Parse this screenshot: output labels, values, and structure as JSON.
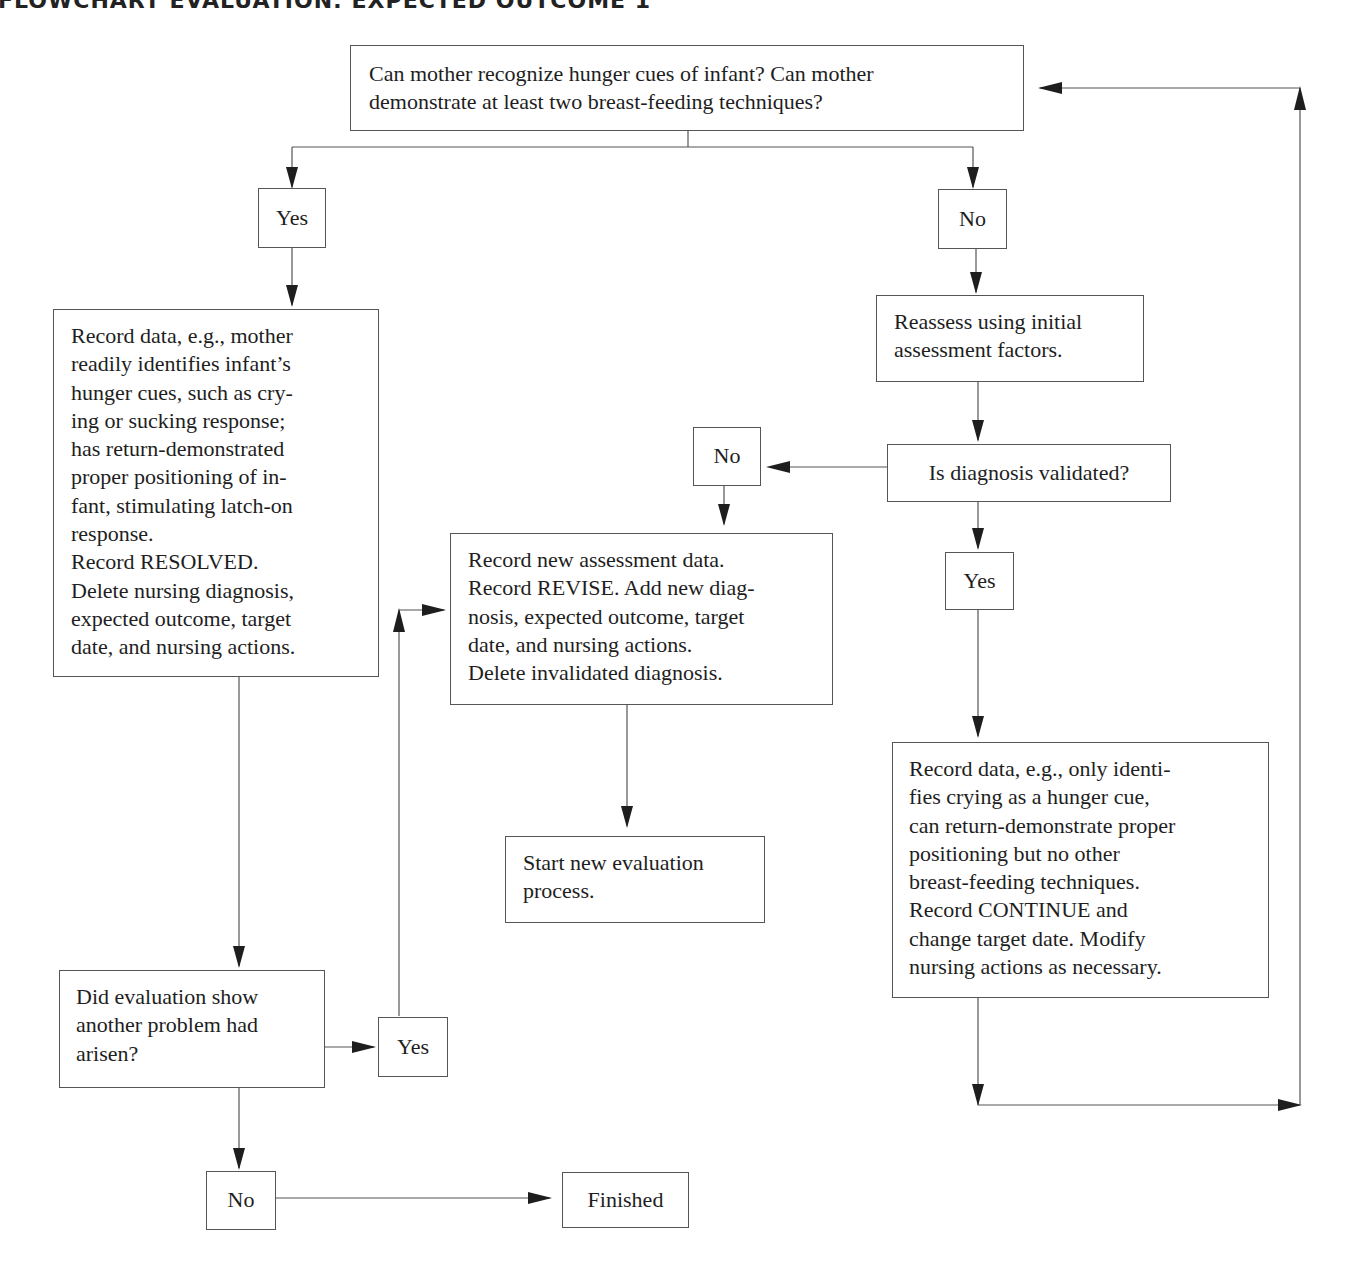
{
  "title": "FLOWCHART EVALUATION: EXPECTED OUTCOME 1",
  "nodes": {
    "start_question": "Can mother recognize hunger cues of infant? Can mother\ndemonstrate at least two breast-feeding techniques?",
    "yes_1": "Yes",
    "no_1": "No",
    "resolved_record": "Record data, e.g., mother\nreadily identifies infant’s\nhunger cues, such as cry-\ning or sucking response;\nhas return-demonstrated\nproper positioning of in-\nfant, stimulating latch-on\nresponse.\nRecord RESOLVED.\nDelete nursing diagnosis,\nexpected outcome, target\ndate, and nursing actions.",
    "reassess": "Reassess using initial\nassessment factors.",
    "diagnosis_validated": "Is diagnosis validated?",
    "no_2": "No",
    "yes_2": "Yes",
    "revise_record": "Record new assessment data.\nRecord REVISE. Add new diag-\nnosis, expected outcome, target\ndate, and nursing actions.\nDelete invalidated diagnosis.",
    "start_new": "Start new evaluation\nprocess.",
    "continue_record": "Record data, e.g., only identi-\nfies crying as a hunger cue,\ncan return-demonstrate proper\npositioning but no other\nbreast-feeding techniques.\nRecord CONTINUE and\nchange target date. Modify\nnursing actions as necessary.",
    "another_problem": "Did evaluation show\nanother problem had\narisen?",
    "yes_3": "Yes",
    "no_3": "No",
    "finished": "Finished"
  },
  "edges": [
    {
      "from": "start_question",
      "to": "yes_1"
    },
    {
      "from": "start_question",
      "to": "no_1"
    },
    {
      "from": "yes_1",
      "to": "resolved_record"
    },
    {
      "from": "no_1",
      "to": "reassess"
    },
    {
      "from": "reassess",
      "to": "diagnosis_validated"
    },
    {
      "from": "diagnosis_validated",
      "to": "no_2"
    },
    {
      "from": "diagnosis_validated",
      "to": "yes_2"
    },
    {
      "from": "no_2",
      "to": "revise_record"
    },
    {
      "from": "revise_record",
      "to": "start_new"
    },
    {
      "from": "yes_2",
      "to": "continue_record"
    },
    {
      "from": "continue_record",
      "to": "start_question"
    },
    {
      "from": "resolved_record",
      "to": "another_problem"
    },
    {
      "from": "another_problem",
      "to": "yes_3"
    },
    {
      "from": "yes_3",
      "to": "revise_record"
    },
    {
      "from": "another_problem",
      "to": "no_3"
    },
    {
      "from": "no_3",
      "to": "finished"
    }
  ]
}
